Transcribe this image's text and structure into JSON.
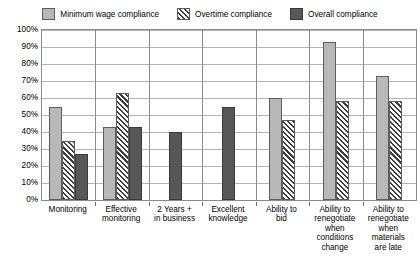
{
  "chart_data": {
    "type": "bar",
    "title": "",
    "xlabel": "",
    "ylabel": "",
    "ylim": [
      0,
      100
    ],
    "ytick_labels": [
      "0%",
      "10%",
      "20%",
      "30%",
      "40%",
      "50%",
      "60%",
      "70%",
      "80%",
      "90%",
      "100%"
    ],
    "ytick_values": [
      0,
      10,
      20,
      30,
      40,
      50,
      60,
      70,
      80,
      90,
      100
    ],
    "grid": true,
    "legend_position": "top",
    "categories": [
      "Monitoring",
      "Effective\nmonitoring",
      "2 Years +\nin business",
      "Excellent\nknowledge",
      "Ability to\nbid",
      "Ability to\nrenegotiate\nwhen\nconditions\nchange",
      "Ability to\nrenegotiate\nwhen\nmaterials\nare late"
    ],
    "series": [
      {
        "name": "Minimum wage compliance",
        "color": "#b8b8b8",
        "pattern": "solid-light",
        "values": [
          55,
          43,
          null,
          null,
          60,
          93,
          73
        ]
      },
      {
        "name": "Overtime compliance",
        "color": "#ffffff",
        "pattern": "diagonal-hatch",
        "values": [
          35,
          63,
          null,
          null,
          47,
          58,
          58
        ]
      },
      {
        "name": "Overall compliance",
        "color": "#575757",
        "pattern": "solid-dark",
        "values": [
          27,
          43,
          40,
          55,
          null,
          null,
          null
        ]
      }
    ]
  }
}
